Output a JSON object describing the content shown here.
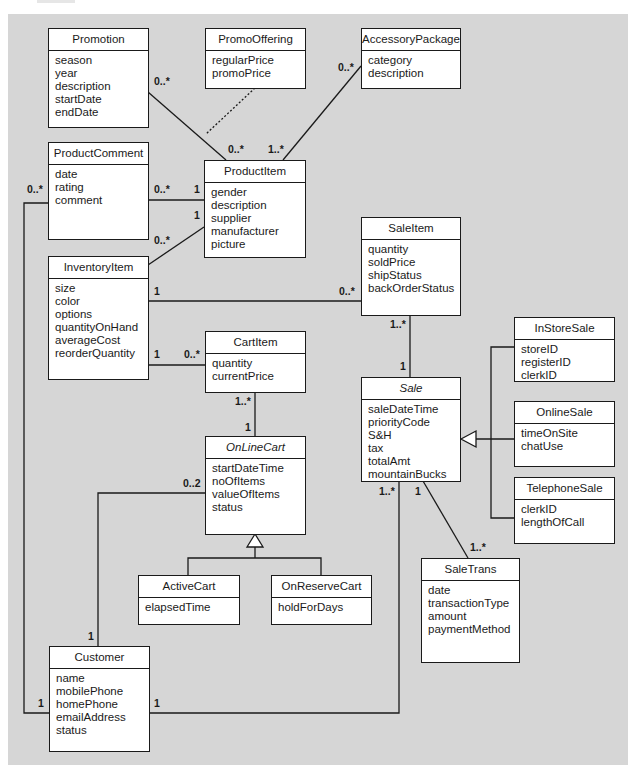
{
  "classes": {
    "promotion": {
      "name": "Promotion",
      "abstract": false,
      "attributes": [
        "season",
        "year",
        "description",
        "startDate",
        "endDate"
      ]
    },
    "promoOffering": {
      "name": "PromoOffering",
      "abstract": false,
      "attributes": [
        "regularPrice",
        "promoPrice"
      ]
    },
    "accessoryPackage": {
      "name": "AccessoryPackage",
      "abstract": false,
      "attributes": [
        "category",
        "description"
      ]
    },
    "productComment": {
      "name": "ProductComment",
      "abstract": false,
      "attributes": [
        "date",
        "rating",
        "comment"
      ]
    },
    "productItem": {
      "name": "ProductItem",
      "abstract": false,
      "attributes": [
        "gender",
        "description",
        "supplier",
        "manufacturer",
        "picture"
      ]
    },
    "inventoryItem": {
      "name": "InventoryItem",
      "abstract": false,
      "attributes": [
        "size",
        "color",
        "options",
        "quantityOnHand",
        "averageCost",
        "reorderQuantity"
      ]
    },
    "saleItem": {
      "name": "SaleItem",
      "abstract": false,
      "attributes": [
        "quantity",
        "soldPrice",
        "shipStatus",
        "backOrderStatus"
      ]
    },
    "cartItem": {
      "name": "CartItem",
      "abstract": false,
      "attributes": [
        "quantity",
        "currentPrice"
      ]
    },
    "inStoreSale": {
      "name": "InStoreSale",
      "abstract": false,
      "attributes": [
        "storeID",
        "registerID",
        "clerkID"
      ]
    },
    "sale": {
      "name": "Sale",
      "abstract": true,
      "attributes": [
        "saleDateTime",
        "priorityCode",
        "S&H",
        "tax",
        "totalAmt",
        "mountainBucks"
      ]
    },
    "onlineSale": {
      "name": "OnlineSale",
      "abstract": false,
      "attributes": [
        "timeOnSite",
        "chatUse"
      ]
    },
    "onLineCart": {
      "name": "OnLineCart",
      "abstract": true,
      "attributes": [
        "startDateTime",
        "noOfItems",
        "valueOfItems",
        "status"
      ]
    },
    "telephoneSale": {
      "name": "TelephoneSale",
      "abstract": false,
      "attributes": [
        "clerkID",
        "lengthOfCall"
      ]
    },
    "activeCart": {
      "name": "ActiveCart",
      "abstract": false,
      "attributes": [
        "elapsedTime"
      ]
    },
    "onReserveCart": {
      "name": "OnReserveCart",
      "abstract": false,
      "attributes": [
        "holdForDays"
      ]
    },
    "saleTrans": {
      "name": "SaleTrans",
      "abstract": false,
      "attributes": [
        "date",
        "transactionType",
        "amount",
        "paymentMethod"
      ]
    },
    "customer": {
      "name": "Customer",
      "abstract": false,
      "attributes": [
        "name",
        "mobilePhone",
        "homePhone",
        "emailAddress",
        "status"
      ]
    }
  },
  "multiplicities": {
    "promotion_productItem_a": "0..*",
    "promotion_productItem_b": "0..*",
    "accessory_productItem_a": "0..*",
    "accessory_productItem_b": "1..*",
    "comment_productItem_a": "0..*",
    "comment_productItem_b": "1",
    "comment_customer": "0..*",
    "inventory_productItem_a": "0..*",
    "inventory_productItem_b": "1",
    "inventory_saleItem_a": "1",
    "inventory_saleItem_b": "0..*",
    "inventory_cartItem_a": "1",
    "inventory_cartItem_b": "0..*",
    "saleItem_sale_a": "1..*",
    "saleItem_sale_b": "1",
    "cartItem_cart_a": "1..*",
    "cartItem_cart_b": "1",
    "cart_customer_a": "0..2",
    "cart_customer_b": "1",
    "customer_comment_b": "1",
    "customer_sale_a": "1",
    "sale_customer_b": "1..*",
    "sale_trans_a": "1",
    "sale_trans_b": "1..*"
  },
  "associations": [
    {
      "from": "Promotion",
      "to": "ProductItem",
      "association_class": "PromoOffering"
    },
    {
      "from": "AccessoryPackage",
      "to": "ProductItem"
    },
    {
      "from": "ProductComment",
      "to": "ProductItem"
    },
    {
      "from": "InventoryItem",
      "to": "ProductItem"
    },
    {
      "from": "InventoryItem",
      "to": "SaleItem"
    },
    {
      "from": "InventoryItem",
      "to": "CartItem"
    },
    {
      "from": "SaleItem",
      "to": "Sale"
    },
    {
      "from": "CartItem",
      "to": "OnLineCart"
    },
    {
      "from": "OnLineCart",
      "to": "Customer"
    },
    {
      "from": "Customer",
      "to": "ProductComment"
    },
    {
      "from": "Customer",
      "to": "Sale"
    },
    {
      "from": "Sale",
      "to": "SaleTrans"
    }
  ],
  "generalizations": [
    {
      "parent": "Sale",
      "children": [
        "InStoreSale",
        "OnlineSale",
        "TelephoneSale"
      ]
    },
    {
      "parent": "OnLineCart",
      "children": [
        "ActiveCart",
        "OnReserveCart"
      ]
    }
  ]
}
